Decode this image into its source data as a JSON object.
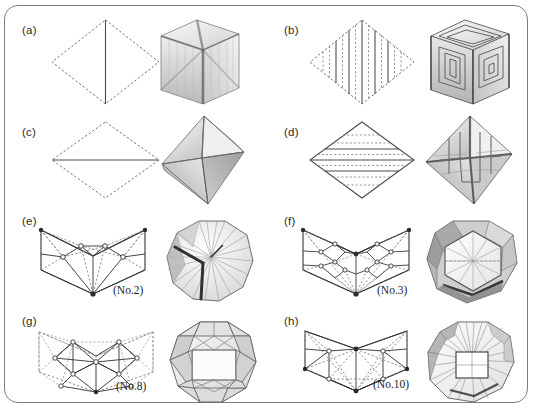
{
  "figure": {
    "type": "plate",
    "border": "rounded-rectangle",
    "border_color": "#7d7d7d",
    "background": "#ffffff",
    "width": 536,
    "height": 410,
    "columns": 2,
    "rows": 4
  },
  "panels": [
    {
      "id": "a",
      "label": "(a)",
      "caption": "",
      "net": {
        "shape": "rhombus",
        "outline_style": "dashed",
        "crease_lines": [
          {
            "orientation": "vertical",
            "style": "solid",
            "count": 1
          }
        ],
        "vertex_markers": false,
        "description": "rhombus net with dashed perimeter and one solid vertical crease through the centre"
      },
      "solid": {
        "name": "cube",
        "faces": 6,
        "view": "three-quarter",
        "shading": "translucent-grey",
        "description": "translucent cube showing internal diagonal creases meeting at the centre"
      }
    },
    {
      "id": "b",
      "label": "(b)",
      "caption": "",
      "net": {
        "shape": "rhombus",
        "outline_style": "dashed",
        "crease_lines": [
          {
            "orientation": "vertical",
            "style": "alternating solid/dashed",
            "count": 9
          }
        ],
        "vertex_markers": false,
        "description": "rhombus net striped by nine vertical creases alternating solid and dashed"
      },
      "solid": {
        "name": "cube",
        "faces": 6,
        "view": "three-quarter",
        "shading": "translucent-grey",
        "description": "cube with concentric square spiral pleating on each visible face"
      }
    },
    {
      "id": "c",
      "label": "(c)",
      "caption": "",
      "net": {
        "shape": "rhombus",
        "outline_style": "dashed",
        "crease_lines": [
          {
            "orientation": "horizontal",
            "style": "solid",
            "count": 1
          }
        ],
        "vertex_markers": false,
        "description": "rhombus net with dashed perimeter and one solid horizontal crease through the centre"
      },
      "solid": {
        "name": "octahedron",
        "faces": 8,
        "view": "three-quarter",
        "shading": "grey-gradient",
        "description": "octahedron with four shaded triangular faces meeting at the apex"
      }
    },
    {
      "id": "d",
      "label": "(d)",
      "caption": "",
      "net": {
        "shape": "rhombus",
        "outline_style": "solid",
        "crease_lines": [
          {
            "orientation": "horizontal",
            "style": "alternating solid/dashed",
            "count": 7
          }
        ],
        "vertex_markers": false,
        "description": "rhombus net crossed by seven horizontal creases alternating solid and dashed"
      },
      "solid": {
        "name": "octahedron",
        "faces": 8,
        "view": "three-quarter",
        "shading": "grey-gradient",
        "description": "octahedron with pleated star-shaped ridges running over the faces"
      }
    },
    {
      "id": "e",
      "label": "(e)",
      "caption": "(No.2)",
      "net": {
        "shape": "chevron",
        "outline_style": "solid",
        "crease_lines": [
          {
            "orientation": "radial",
            "style": "mixed solid and dashed",
            "count": 20
          }
        ],
        "vertex_markers": true,
        "description": "V-shaped chevron net with radial solid and dashed creases fanning from the bottom vertex and circular vertex markers"
      },
      "solid": {
        "name": "pleated polyhedron No.2",
        "faces": 0,
        "view": "front",
        "shading": "grey-gradient",
        "description": "decagonal outline solid with fan pleats and a dark Y-shaped valley crease"
      }
    },
    {
      "id": "f",
      "label": "(f)",
      "caption": "(No.3)",
      "net": {
        "shape": "chevron",
        "outline_style": "solid",
        "crease_lines": [
          {
            "orientation": "radial",
            "style": "mixed solid and dashed",
            "count": 30
          }
        ],
        "vertex_markers": true,
        "description": "V-shaped chevron net with a lattice of small squares and radial dashed creases, circular vertex markers"
      },
      "solid": {
        "name": "pleated polyhedron No.3",
        "faces": 0,
        "view": "front",
        "shading": "grey-gradient",
        "description": "hexagonal-faced solid with bevelled shaded rim and radial creases on the front hexagon"
      }
    },
    {
      "id": "g",
      "label": "(g)",
      "caption": "(No.8)",
      "net": {
        "shape": "chevron",
        "outline_style": "dashed",
        "crease_lines": [
          {
            "orientation": "triangular lattice",
            "style": "mixed solid and dashed",
            "count": 34
          }
        ],
        "vertex_markers": true,
        "description": "wide chevron net of triangulated lattice with dashed perimeter and open circular vertex markers"
      },
      "solid": {
        "name": "pleated polyhedron No.8",
        "faces": 0,
        "view": "front",
        "shading": "light-grey",
        "description": "rhombicuboctahedron-like solid with a large white square face centred on the front"
      }
    },
    {
      "id": "h",
      "label": "(h)",
      "caption": "(No.10)",
      "net": {
        "shape": "chevron",
        "outline_style": "solid",
        "crease_lines": [
          {
            "orientation": "radial",
            "style": "mixed solid and dashed",
            "count": 22
          }
        ],
        "vertex_markers": true,
        "description": "V-shaped chevron net with radial dashed creases from the top vertex and circular vertex markers"
      },
      "solid": {
        "name": "pleated polyhedron No.10",
        "faces": 0,
        "view": "front",
        "shading": "light-grey",
        "description": "octagonal solid with a central square window and fan pleats radiating outward"
      }
    }
  ],
  "colors": {
    "ink": "#1d1d1d",
    "dash": "#6f6f6f",
    "border": "#7d7d7d",
    "fill_light": "#f2f2f2",
    "fill_mid": "#d8d8d8",
    "fill_dark": "#9a9a9a",
    "shadow": "#3a3a3a"
  }
}
